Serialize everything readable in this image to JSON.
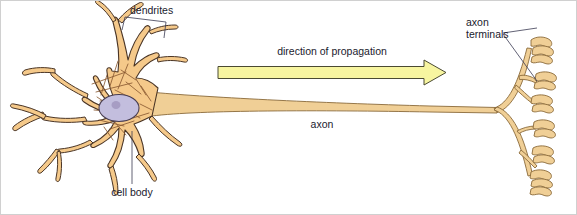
{
  "figure": {
    "background_color": "#ffffff",
    "border_color": "#c8c8c8"
  },
  "labels": {
    "dendrites": "dendrites",
    "cell_body": "cell body",
    "axon": "axon",
    "axon_terminals_line1": "axon",
    "axon_terminals_line2": "terminals",
    "direction_of_propagation": "direction of propagation"
  },
  "colors": {
    "cell_fill": "#f5c98a",
    "cell_outline": "#4a3526",
    "axon_fill": "#f0cf96",
    "axon_outline": "#8a6a3a",
    "nucleus_fill": "#c3bede",
    "nucleus_outline": "#4a3f52",
    "nucleolus_fill": "#a79dc4",
    "striation": "#8a5a32",
    "arrow_fill": "#f7f5a0",
    "arrow_outline": "#4a4a32",
    "leader_line": "#3a3a52",
    "text": "#1a1a2e"
  },
  "arrow": {
    "direction": "left-to-right",
    "x_start": 218,
    "x_end": 446,
    "shaft_top": 66,
    "shaft_bottom": 79,
    "head_top": 60,
    "head_bottom": 85
  },
  "parts": [
    {
      "name": "dendrites",
      "count": 8,
      "region": "left"
    },
    {
      "name": "cell body",
      "count": 1,
      "region": "left-center"
    },
    {
      "name": "nucleus",
      "count": 1,
      "region": "left-center"
    },
    {
      "name": "axon",
      "count": 1,
      "region": "center"
    },
    {
      "name": "axon terminals",
      "count": 6,
      "region": "right"
    }
  ]
}
